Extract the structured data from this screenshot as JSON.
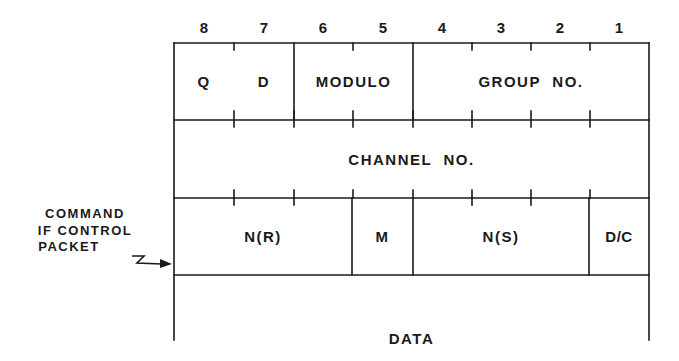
{
  "diagram": {
    "type": "packet-header-format",
    "bit_numbers": [
      "8",
      "7",
      "6",
      "5",
      "4",
      "3",
      "2",
      "1"
    ],
    "rows": [
      {
        "name": "octet-1",
        "fields": [
          {
            "label_parts": [
              "Q",
              "D"
            ],
            "bits": "8-7"
          },
          {
            "label": "MODULO",
            "bits": "6-5"
          },
          {
            "label": "GROUP NO.",
            "bits": "4-1"
          }
        ]
      },
      {
        "name": "octet-2",
        "fields": [
          {
            "label": "CHANNEL NO.",
            "bits": "8-1"
          }
        ]
      },
      {
        "name": "octet-3",
        "fields": [
          {
            "label": "N(R)",
            "bits": "8-6"
          },
          {
            "label": "M",
            "bits": "5"
          },
          {
            "label": "N(S)",
            "bits": "4-2"
          },
          {
            "label": "D/C",
            "bits": "1"
          }
        ]
      },
      {
        "name": "data",
        "fields": [
          {
            "label": "DATA",
            "bits": "8-1"
          }
        ]
      }
    ],
    "annotation": {
      "lines": [
        "COMMAND",
        "IF CONTROL",
        "PACKET"
      ],
      "points_to": "octet-3"
    }
  }
}
